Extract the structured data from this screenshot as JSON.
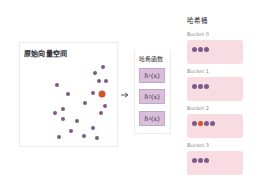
{
  "colors": {
    "point": "#7d5a8a",
    "query_point": "#d2542a",
    "bucket_fill": "#f9dbe2",
    "hash_fn_fill": "#d9bfd9"
  },
  "vector_space": {
    "title": "原始向量空间",
    "points": [
      {
        "x": 103,
        "y": 67,
        "kind": "point"
      },
      {
        "x": 95,
        "y": 73,
        "kind": "point"
      },
      {
        "x": 99,
        "y": 81,
        "kind": "point"
      },
      {
        "x": 106,
        "y": 81,
        "kind": "point"
      },
      {
        "x": 57,
        "y": 85,
        "kind": "point"
      },
      {
        "x": 68,
        "y": 94,
        "kind": "point"
      },
      {
        "x": 93,
        "y": 93,
        "kind": "point"
      },
      {
        "x": 102,
        "y": 94,
        "kind": "query"
      },
      {
        "x": 85,
        "y": 103,
        "kind": "point"
      },
      {
        "x": 105,
        "y": 106,
        "kind": "point"
      },
      {
        "x": 63,
        "y": 109,
        "kind": "point"
      },
      {
        "x": 55,
        "y": 113,
        "kind": "point"
      },
      {
        "x": 101,
        "y": 113,
        "kind": "point"
      },
      {
        "x": 63,
        "y": 119,
        "kind": "point"
      },
      {
        "x": 77,
        "y": 121,
        "kind": "point"
      },
      {
        "x": 93,
        "y": 128,
        "kind": "point"
      },
      {
        "x": 71,
        "y": 131,
        "kind": "point"
      },
      {
        "x": 59,
        "y": 137,
        "kind": "point"
      },
      {
        "x": 84,
        "y": 136,
        "kind": "point"
      },
      {
        "x": 97,
        "y": 138,
        "kind": "point"
      }
    ]
  },
  "arrow": {
    "icon": "arrow-right-icon"
  },
  "hash_functions": {
    "title": "哈希函数",
    "items": [
      {
        "name": "h",
        "index": "1",
        "arg": "(x)"
      },
      {
        "name": "h",
        "index": "2",
        "arg": "(x)"
      },
      {
        "name": "h",
        "index": "3",
        "arg": "(x)"
      }
    ]
  },
  "hash_table": {
    "title": "哈希桶",
    "buckets": [
      {
        "label": "Bucket 0",
        "items": [
          "point",
          "point",
          "point"
        ]
      },
      {
        "label": "Bucket 1",
        "items": [
          "point",
          "point",
          "point"
        ]
      },
      {
        "label": "Bucket 2",
        "items": [
          "point",
          "query",
          "point",
          "point"
        ]
      },
      {
        "label": "Bucket 3",
        "items": [
          "point",
          "point",
          "point"
        ]
      }
    ]
  }
}
